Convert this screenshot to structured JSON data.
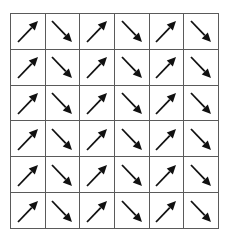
{
  "diagram": {
    "type": "arrow-grid",
    "rows": 6,
    "columns": 6,
    "line_color": "#5a5a5a",
    "arrow_color": "#111111",
    "column_pattern": [
      "up-right",
      "down-right",
      "up-right",
      "down-right",
      "up-right",
      "down-right"
    ],
    "cells": [
      [
        "up-right",
        "down-right",
        "up-right",
        "down-right",
        "up-right",
        "down-right"
      ],
      [
        "up-right",
        "down-right",
        "up-right",
        "down-right",
        "up-right",
        "down-right"
      ],
      [
        "up-right",
        "down-right",
        "up-right",
        "down-right",
        "up-right",
        "down-right"
      ],
      [
        "up-right",
        "down-right",
        "up-right",
        "down-right",
        "up-right",
        "down-right"
      ],
      [
        "up-right",
        "down-right",
        "up-right",
        "down-right",
        "up-right",
        "down-right"
      ],
      [
        "up-right",
        "down-right",
        "up-right",
        "down-right",
        "up-right",
        "down-right"
      ]
    ]
  }
}
